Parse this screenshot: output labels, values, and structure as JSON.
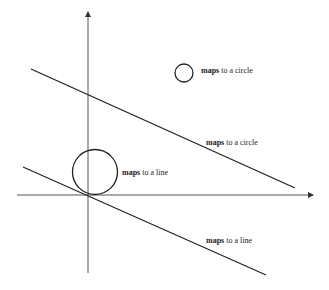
{
  "diagram": {
    "colors": {
      "axis": "#555555",
      "shape": "#222222",
      "background": "#ffffff"
    },
    "axes": {
      "origin": [
        88,
        195
      ],
      "x_axis": {
        "start": [
          17,
          195
        ],
        "end": [
          313,
          195
        ]
      },
      "y_axis": {
        "start": [
          88,
          273
        ],
        "end": [
          88,
          12
        ]
      }
    },
    "shapes": [
      {
        "type": "circle",
        "cx": 184,
        "cy": 73,
        "r": 9,
        "label_bold": "maps",
        "label_rest": " to a circle",
        "label_pos": [
          201,
          70
        ]
      },
      {
        "type": "line",
        "x1": 31,
        "y1": 69,
        "x2": 295,
        "y2": 188,
        "label_bold": "maps",
        "label_rest": " to a circle",
        "label_pos": [
          206,
          145
        ]
      },
      {
        "type": "circle",
        "cx": 95,
        "cy": 172,
        "r": 22,
        "label_bold": "maps",
        "label_rest": " to a line",
        "label_pos": [
          122,
          172
        ]
      },
      {
        "type": "line",
        "x1": 23,
        "y1": 167,
        "x2": 266,
        "y2": 275,
        "label_bold": "maps",
        "label_rest": " to a line",
        "label_pos": [
          206,
          242
        ]
      }
    ],
    "labels": {
      "small_circle": {
        "bold": "maps",
        "rest": " to a circle"
      },
      "upper_line": {
        "bold": "maps",
        "rest": " to a circle"
      },
      "large_circle": {
        "bold": "maps",
        "rest": " to a line"
      },
      "lower_line": {
        "bold": "maps",
        "rest": " to a line"
      }
    }
  }
}
